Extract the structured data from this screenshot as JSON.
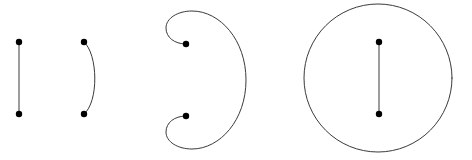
{
  "canvas": {
    "width": 472,
    "height": 160,
    "background_color": "#ffffff",
    "stroke_color": "#3a3a3a",
    "point_color": "#000000",
    "stroke_width": 1,
    "point_radius": 3.2
  },
  "figures": [
    {
      "id": "figure-1",
      "name": "straight-segment",
      "description": "Vertical straight line segment with endpoint dots",
      "path": "M 19 42 L 19 114",
      "points": [
        {
          "name": "endpoint-top",
          "cx": 19,
          "cy": 42
        },
        {
          "name": "endpoint-bottom",
          "cx": 19,
          "cy": 114
        }
      ]
    },
    {
      "id": "figure-2",
      "name": "single-arc",
      "description": "Arc bulging to the right joining two vertically aligned endpoints",
      "path": "M 84 42 C 98 54, 99 102, 84 114",
      "points": [
        {
          "name": "endpoint-top",
          "cx": 84,
          "cy": 42
        },
        {
          "name": "endpoint-bottom",
          "cx": 84,
          "cy": 114
        }
      ]
    },
    {
      "id": "figure-3",
      "name": "double-spiral",
      "description": "Large right-bulging curve terminating in two inward spiral hooks",
      "path": "M 186 44 C 174 44, 166 37, 166 28 C 166 18, 178 11, 192 11 C 220 11, 246 40, 246 80 C 246 120, 220 149, 192 149 C 178 149, 166 142, 166 132 C 166 123, 174 116, 186 116",
      "points": [
        {
          "name": "endpoint-upper-hook",
          "cx": 186,
          "cy": 44
        },
        {
          "name": "endpoint-lower-hook",
          "cx": 186,
          "cy": 116
        }
      ]
    },
    {
      "id": "figure-4",
      "name": "circle-with-chord",
      "description": "Full circle enclosing a vertical segment with endpoint dots",
      "circle": {
        "cx": 378,
        "cy": 78,
        "r": 74
      },
      "path": "M 379 42 L 379 114",
      "points": [
        {
          "name": "endpoint-top",
          "cx": 379,
          "cy": 42
        },
        {
          "name": "endpoint-bottom",
          "cx": 379,
          "cy": 114
        }
      ]
    }
  ]
}
